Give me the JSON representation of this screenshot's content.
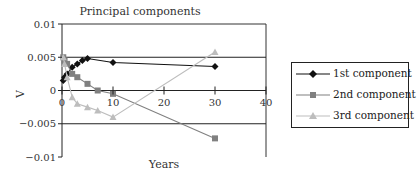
{
  "chart_data": {
    "type": "line",
    "title": "Principal components",
    "xlabel": "Years",
    "ylabel": "V",
    "xlim": [
      0,
      40
    ],
    "ylim": [
      -0.01,
      0.01
    ],
    "x_ticks": [
      "0",
      "10",
      "20",
      "30",
      "40"
    ],
    "y_ticks": [
      "0.01",
      "0.005",
      "0",
      "-0.005",
      "-0.01"
    ],
    "grid": "horizontal major gridlines at ±0.005 and 0.01",
    "legend_position": "right",
    "series": [
      {
        "name": "1st component",
        "marker": "diamond",
        "color": "#111111",
        "x": [
          0.25,
          0.5,
          1,
          2,
          3,
          4,
          5,
          10,
          30
        ],
        "values": [
          0.0015,
          0.002,
          0.0025,
          0.0035,
          0.004,
          0.0045,
          0.0048,
          0.0042,
          0.0036
        ]
      },
      {
        "name": "2nd component",
        "marker": "square",
        "color": "#808080",
        "x": [
          0.25,
          0.5,
          1,
          2,
          3,
          5,
          7,
          10,
          30
        ],
        "values": [
          0.005,
          0.0045,
          0.004,
          0.0025,
          0.002,
          0.001,
          0.0,
          -0.0005,
          -0.0072
        ]
      },
      {
        "name": "3rd component",
        "marker": "triangle",
        "color": "#bdbdbd",
        "x": [
          0.25,
          0.5,
          1,
          2,
          3,
          5,
          7,
          10,
          30
        ],
        "values": [
          0.005,
          0.004,
          0.002,
          -0.001,
          -0.002,
          -0.0025,
          -0.003,
          -0.004,
          0.0058
        ]
      }
    ]
  }
}
